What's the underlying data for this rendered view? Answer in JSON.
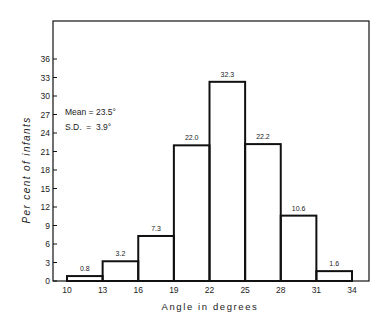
{
  "chart_data": {
    "type": "bar",
    "subtype": "histogram",
    "title": "",
    "xlabel": "Angle in degrees",
    "ylabel": "Per cent of infants",
    "bin_edges": [
      10,
      13,
      16,
      19,
      22,
      25,
      28,
      31,
      34
    ],
    "categories": [
      "10-13",
      "13-16",
      "16-19",
      "19-22",
      "22-25",
      "25-28",
      "28-31",
      "31-34"
    ],
    "values": [
      0.8,
      3.2,
      7.3,
      22.0,
      32.3,
      22.2,
      10.6,
      1.6
    ],
    "value_labels": [
      "0.8",
      "3.2",
      "7.3",
      "22.0",
      "32.3",
      "22.2",
      "10.6",
      "1.6"
    ],
    "x_ticks": [
      "10",
      "13",
      "16",
      "19",
      "22",
      "25",
      "28",
      "31",
      "34"
    ],
    "y_ticks": [
      "0",
      "3",
      "6",
      "9",
      "12",
      "15",
      "18",
      "21",
      "24",
      "27",
      "30",
      "33",
      "36"
    ],
    "ylim": [
      0,
      39
    ],
    "xlim": [
      9,
      35.5
    ],
    "grid": false,
    "annotations": [
      "Mean = 23.5°",
      "S.D.  =  3.9°"
    ]
  },
  "stats": {
    "mean_label": "Mean = 23.5°",
    "sd_label": "S.D.  =  3.9°"
  },
  "colors": {
    "line": "#111111",
    "background": "#ffffff"
  }
}
